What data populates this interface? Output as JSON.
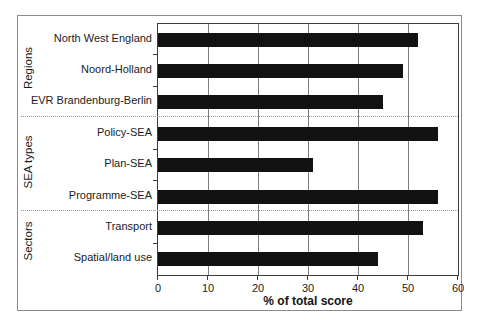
{
  "chart_data": {
    "type": "bar",
    "orientation": "horizontal",
    "title": "",
    "xlabel": "% of total score",
    "ylabel": "",
    "xlim": [
      0,
      60
    ],
    "xticks": [
      0,
      10,
      20,
      30,
      40,
      50,
      60
    ],
    "grid": "vertical gridlines every 10 units",
    "legend": "none",
    "bar_color": "#121212",
    "categories": [
      "North West England",
      "Noord-Holland",
      "EVR Brandenburg-Berlin",
      "Policy-SEA",
      "Plan-SEA",
      "Programme-SEA",
      "Transport",
      "Spatial/land use"
    ],
    "values": [
      52,
      49,
      45,
      56,
      31,
      56,
      53,
      44
    ],
    "groups": [
      {
        "label": "Regions",
        "items": [
          {
            "label": "North West England",
            "value": 52
          },
          {
            "label": "Noord-Holland",
            "value": 49
          },
          {
            "label": "EVR Brandenburg-Berlin",
            "value": 45
          }
        ]
      },
      {
        "label": "SEA types",
        "items": [
          {
            "label": "Policy-SEA",
            "value": 56
          },
          {
            "label": "Plan-SEA",
            "value": 31
          },
          {
            "label": "Programme-SEA",
            "value": 56
          }
        ]
      },
      {
        "label": "Sectors",
        "items": [
          {
            "label": "Transport",
            "value": 53
          },
          {
            "label": "Spatial/land use",
            "value": 44
          }
        ]
      }
    ]
  }
}
